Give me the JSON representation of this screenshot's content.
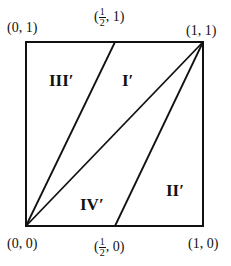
{
  "diagram": {
    "type": "unit-square-partition",
    "corners": {
      "top_left": "(0, 1)",
      "top_right": "(1, 1)",
      "bottom_left": "(0, 0)",
      "bottom_right": "(1, 0)"
    },
    "midpoints": {
      "top": {
        "open": "(",
        "num": "1",
        "den": "2",
        "close": ", 1)"
      },
      "bottom": {
        "open": "(",
        "num": "1",
        "den": "2",
        "close": ", 0)"
      }
    },
    "regions": [
      {
        "id": "III",
        "label": "III′"
      },
      {
        "id": "I",
        "label": "I′"
      },
      {
        "id": "IV",
        "label": "IV′"
      },
      {
        "id": "II",
        "label": "II′"
      }
    ],
    "lines": [
      {
        "from": "(0,0)",
        "to": "(1/2,1)"
      },
      {
        "from": "(0,0)",
        "to": "(1,1)"
      },
      {
        "from": "(1/2,0)",
        "to": "(1,1)"
      }
    ],
    "stroke_color": "#111111"
  }
}
